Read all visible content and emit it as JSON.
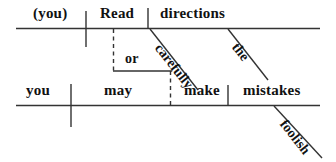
{
  "diagram": {
    "type": "reed-kellogg-sentence-diagram",
    "sentence": "(You) read directions carefully or you may make foolish mistakes.",
    "line_color": "#333333",
    "text_color": "#111111",
    "clauses": [
      {
        "id": "top-clause",
        "subject": "(you)",
        "verb": "Read",
        "object": "directions",
        "modifiers": [
          {
            "word": "carefully",
            "attaches_to": "Read"
          },
          {
            "word": "the",
            "attaches_to": "directions"
          }
        ]
      },
      {
        "id": "bottom-clause",
        "subject": "you",
        "verb": "may",
        "verb2": "make",
        "object": "mistakes",
        "modifiers": [
          {
            "word": "foolish",
            "attaches_to": "mistakes"
          }
        ]
      }
    ],
    "conjunction": "or",
    "words": {
      "you_implied": "(you)",
      "read": "Read",
      "directions": "directions",
      "carefully": "carefully",
      "the": "the",
      "or": "or",
      "you": "you",
      "may": "may",
      "make": "make",
      "mistakes": "mistakes",
      "foolish": "foolish"
    }
  }
}
